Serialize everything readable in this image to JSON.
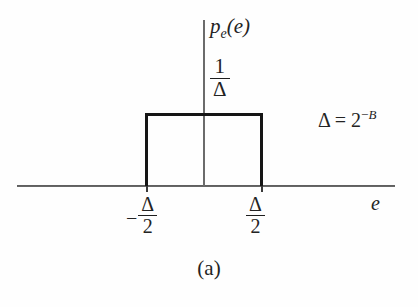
{
  "figure": {
    "caption": "(a)",
    "background_color": "#fefefe",
    "line_color": "#151515",
    "axis_color": "#3d3d3d"
  },
  "axes": {
    "x_axis_label": "e",
    "y_axis_label_base": "p",
    "y_axis_label_sub": "e",
    "y_axis_label_arg": "(e)"
  },
  "labels": {
    "height_numerator": "1",
    "height_denominator": "Δ",
    "left_tick_minus": "−",
    "left_tick_numerator": "Δ",
    "left_tick_denominator": "2",
    "right_tick_numerator": "Δ",
    "right_tick_denominator": "2",
    "annotation_lhs": "Δ = 2",
    "annotation_exponent_sign": "−",
    "annotation_exponent": "B"
  },
  "chart_data": {
    "type": "area",
    "title": "",
    "subtitle": "",
    "xlabel": "e",
    "ylabel": "p_e(e)",
    "grid": false,
    "legend": null,
    "x": [
      "-Δ/2",
      "-Δ/2",
      "Δ/2",
      "Δ/2"
    ],
    "y": [
      0,
      "1/Δ",
      "1/Δ",
      0
    ],
    "series": [
      {
        "name": "p_e(e)",
        "points": [
          {
            "x": "-Δ/2",
            "y": 0
          },
          {
            "x": "-Δ/2",
            "y": "1/Δ"
          },
          {
            "x": "Δ/2",
            "y": "1/Δ"
          },
          {
            "x": "Δ/2",
            "y": 0
          }
        ]
      }
    ],
    "xticks": [
      "-Δ/2",
      "Δ/2"
    ],
    "yticks": [
      "1/Δ"
    ],
    "annotations": [
      "Δ = 2^{-B}"
    ],
    "xlim": [
      "-Δ",
      "Δ"
    ],
    "ylim": [
      0,
      "1/Δ"
    ]
  }
}
